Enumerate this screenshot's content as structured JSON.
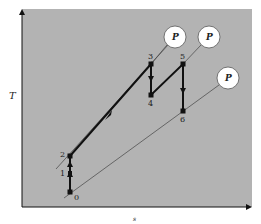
{
  "diagram": {
    "type": "T-s diagram",
    "colors": {
      "plot_background": "#b3b3b3",
      "process_line": "#111111",
      "isobar_line": "#444444",
      "circle_fill": "#ffffff"
    },
    "axes": {
      "y_label": "T",
      "x_label": "s"
    },
    "points": [
      {
        "label": "0",
        "x": 70,
        "y": 192
      },
      {
        "label": "1",
        "x": 70,
        "y": 173
      },
      {
        "label": "2",
        "x": 70,
        "y": 156
      },
      {
        "label": "3",
        "x": 151,
        "y": 64
      },
      {
        "label": "4",
        "x": 151,
        "y": 95
      },
      {
        "label": "5",
        "x": 183,
        "y": 64
      },
      {
        "label": "6",
        "x": 183,
        "y": 111
      }
    ],
    "isobar_labels": [
      {
        "text": "P",
        "cx": 175,
        "cy": 37
      },
      {
        "text": "P",
        "cx": 209,
        "cy": 37
      },
      {
        "text": "P",
        "cx": 228,
        "cy": 78
      }
    ],
    "process_path": [
      "0",
      "1",
      "2",
      "3",
      "4",
      "5",
      "6"
    ]
  }
}
